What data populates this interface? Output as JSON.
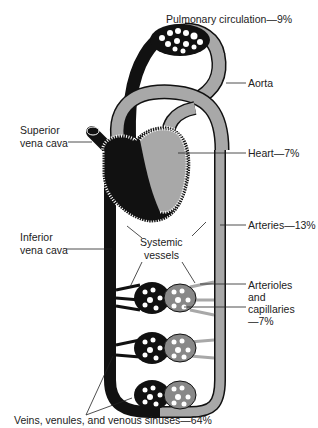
{
  "labels": {
    "pulmonary": "Pulmonary circulation—9%",
    "aorta": "Aorta",
    "superior_vc_1": "Superior",
    "superior_vc_2": "vena cava",
    "heart": "Heart—7%",
    "arteries": "Arteries—13%",
    "inferior_vc_1": "Inferior",
    "inferior_vc_2": "vena cava",
    "systemic_1": "Systemic",
    "systemic_2": "vessels",
    "arterioles_1": "Arterioles",
    "arterioles_2": "and",
    "arterioles_3": "capillaries",
    "arterioles_4": "—7%",
    "veins": "Veins, venules, and venous sinuses—64%"
  },
  "colors": {
    "venous": "#111111",
    "arterial": "#a8a8a8",
    "outline": "#111111",
    "background": "#ffffff"
  }
}
